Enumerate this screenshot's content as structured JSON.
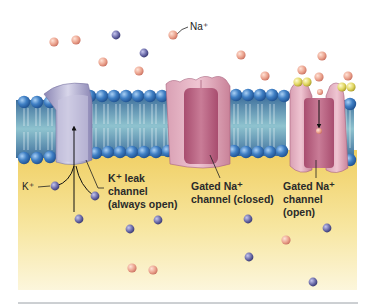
{
  "diagram": {
    "labels": {
      "na_ion": "Na⁺",
      "k_ion": "K⁺",
      "k_leak": [
        "K⁺ leak",
        "channel",
        "(always open)"
      ],
      "gated_closed": [
        "Gated Na⁺",
        "channel (closed)"
      ],
      "gated_open": [
        "Gated Na⁺",
        "channel",
        "(open)"
      ]
    },
    "colors": {
      "extracellular": "#ffffff",
      "cytoplasm_top": "#f2d36a",
      "cytoplasm_bottom": "#fbf3d0",
      "phospholipid_head": "#3f7fc4",
      "membrane_core": "#4f8fa8",
      "k_channel": "#a8a3c6",
      "na_channel": "#c97f9a",
      "na_ion": "#eba38e",
      "k_ion": "#6a6aa8",
      "gate_ball": "#e0d660",
      "divider": "#9aa0a6"
    },
    "ions": {
      "na_outside": [
        [
          54,
          42
        ],
        [
          76,
          40
        ],
        [
          103,
          62
        ],
        [
          139,
          71
        ],
        [
          173,
          35
        ],
        [
          241,
          55
        ],
        [
          265,
          76
        ],
        [
          302,
          70
        ],
        [
          319,
          77
        ],
        [
          348,
          76
        ],
        [
          322,
          56
        ]
      ],
      "k_outside": [
        [
          116,
          35
        ],
        [
          144,
          53
        ]
      ],
      "na_inside": [
        [
          132,
          268
        ],
        [
          153,
          270
        ],
        [
          286,
          240
        ]
      ],
      "k_inside": [
        [
          55,
          186
        ],
        [
          95,
          196
        ],
        [
          79,
          219
        ],
        [
          130,
          229
        ],
        [
          158,
          220
        ],
        [
          248,
          219
        ],
        [
          327,
          228
        ],
        [
          249,
          257
        ],
        [
          313,
          282
        ]
      ]
    }
  }
}
